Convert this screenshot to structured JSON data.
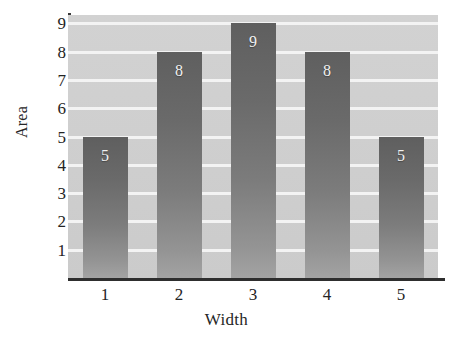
{
  "chart_data": {
    "type": "bar",
    "title": "",
    "xlabel": "Width",
    "ylabel": "Area",
    "categories": [
      "1",
      "2",
      "3",
      "4",
      "5"
    ],
    "values": [
      5,
      8,
      9,
      8,
      5
    ],
    "value_labels": [
      "5",
      "8",
      "9",
      "8",
      "5"
    ],
    "ytick_labels": [
      "9",
      "8",
      "7",
      "6",
      "5",
      "4",
      "3",
      "2",
      "1"
    ],
    "yticks": [
      9,
      8,
      7,
      6,
      5,
      4,
      3,
      2,
      1
    ],
    "ylim": [
      0,
      9.3
    ],
    "xlim": [
      0.5,
      5.5
    ],
    "grid": true,
    "grid_orientation": "horizontal",
    "legend": null,
    "bar_label_position": "inside-top",
    "colors": {
      "plot_background": "#cfcfcf",
      "gridline": "#f4f4f4",
      "bar_top": "#5f5f5f",
      "bar_bottom": "#a3a3a3",
      "bar_value_text": "#f2f2f2",
      "axis_line": "#2e2e2e",
      "tick_text": "#242424",
      "figure_background": "#ffffff"
    }
  }
}
